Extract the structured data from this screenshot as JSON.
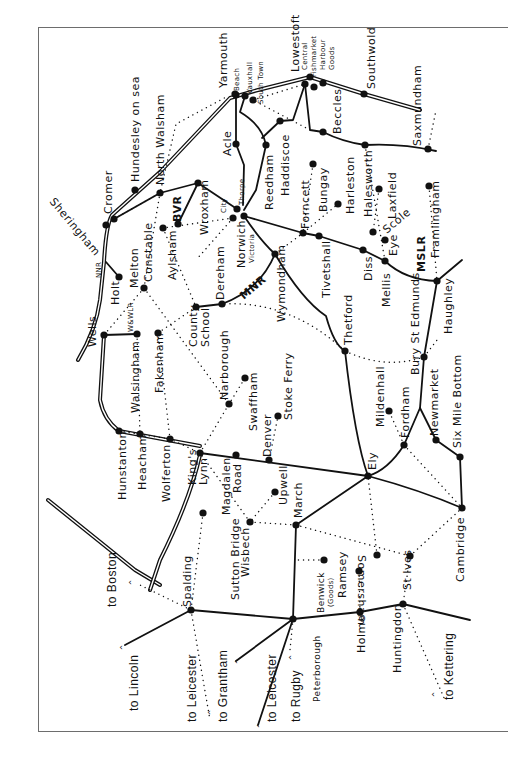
{
  "map": {
    "title": "East Anglia railway network",
    "colors": {
      "ink": "#111111",
      "frame": "#6d6d6d",
      "paper": "#ffffff"
    },
    "stations": [
      {
        "name": "Yarmouth",
        "x": 236,
        "y": 95
      },
      {
        "name": "Beach",
        "x": 235,
        "y": 94
      },
      {
        "name": "Vauxhall",
        "x": 245,
        "y": 96
      },
      {
        "name": "South Town",
        "x": 253,
        "y": 100
      },
      {
        "name": "Lowestoft",
        "x": 310,
        "y": 77
      },
      {
        "name": "Central",
        "x": 305,
        "y": 84
      },
      {
        "name": "Fishmarket",
        "x": 314,
        "y": 87
      },
      {
        "name": "Harbour",
        "x": 323,
        "y": 83
      },
      {
        "name": "Southwold",
        "x": 364,
        "y": 94
      },
      {
        "name": "Saxmundham",
        "x": 428,
        "y": 149
      },
      {
        "name": "Beccles",
        "x": 323,
        "y": 132
      },
      {
        "name": "Haddiscoe",
        "x": 280,
        "y": 121
      },
      {
        "name": "Acle",
        "x": 236,
        "y": 144
      },
      {
        "name": "Reedham",
        "x": 266,
        "y": 145
      },
      {
        "name": "Halesworth",
        "x": 365,
        "y": 145
      },
      {
        "name": "Laxfield",
        "x": 379,
        "y": 189
      },
      {
        "name": "Framlingham",
        "x": 429,
        "y": 186
      },
      {
        "name": "Harleston",
        "x": 338,
        "y": 204
      },
      {
        "name": "Bungay",
        "x": 313,
        "y": 164
      },
      {
        "name": "Forncett",
        "x": 303,
        "y": 233
      },
      {
        "name": "Tivetshall",
        "x": 319,
        "y": 236
      },
      {
        "name": "Diss",
        "x": 363,
        "y": 250
      },
      {
        "name": "Scole",
        "x": 373,
        "y": 232
      },
      {
        "name": "Eye",
        "x": 385,
        "y": 240
      },
      {
        "name": "Mellis",
        "x": 385,
        "y": 261
      },
      {
        "name": "Haughley",
        "x": 437,
        "y": 281
      },
      {
        "name": "Bury St Edmunds",
        "x": 424,
        "y": 357
      },
      {
        "name": "Thetford",
        "x": 345,
        "y": 351
      },
      {
        "name": "Wymondham",
        "x": 275,
        "y": 254
      },
      {
        "name": "Norwich Thorpe",
        "x": 237,
        "y": 209
      },
      {
        "name": "Norwich City",
        "x": 233,
        "y": 218
      },
      {
        "name": "Norwich Victoria",
        "x": 244,
        "y": 216
      },
      {
        "name": "Wroxham",
        "x": 198,
        "y": 183
      },
      {
        "name": "North Walsham",
        "x": 160,
        "y": 193
      },
      {
        "name": "Hundesley on sea",
        "x": 135,
        "y": 190
      },
      {
        "name": "Cromer",
        "x": 114,
        "y": 219
      },
      {
        "name": "Sheringham",
        "x": 106,
        "y": 225
      },
      {
        "name": "Aylsham",
        "x": 163,
        "y": 228
      },
      {
        "name": "BVR",
        "x": 178,
        "y": 224
      },
      {
        "name": "Melton Constable",
        "x": 144,
        "y": 288
      },
      {
        "name": "Holt",
        "x": 119,
        "y": 277
      },
      {
        "name": "Wells",
        "x": 104,
        "y": 335
      },
      {
        "name": "Walsingham",
        "x": 137,
        "y": 334
      },
      {
        "name": "Fakenham",
        "x": 158,
        "y": 333
      },
      {
        "name": "County School",
        "x": 196,
        "y": 307
      },
      {
        "name": "Dereham",
        "x": 222,
        "y": 304
      },
      {
        "name": "Narborough",
        "x": 229,
        "y": 404
      },
      {
        "name": "Swaffham",
        "x": 245,
        "y": 378
      },
      {
        "name": "Stoke Ferry",
        "x": 278,
        "y": 416
      },
      {
        "name": "Denver",
        "x": 269,
        "y": 460
      },
      {
        "name": "Hunstanton",
        "x": 119,
        "y": 431
      },
      {
        "name": "Heacham",
        "x": 140,
        "y": 434
      },
      {
        "name": "Wolferton",
        "x": 170,
        "y": 439
      },
      {
        "name": "King's Lynn",
        "x": 200,
        "y": 453
      },
      {
        "name": "Magdalen Road",
        "x": 236,
        "y": 455
      },
      {
        "name": "Upwell",
        "x": 275,
        "y": 492
      },
      {
        "name": "March",
        "x": 296,
        "y": 525
      },
      {
        "name": "Wisbech",
        "x": 250,
        "y": 522
      },
      {
        "name": "Sutton Bridge",
        "x": 203,
        "y": 513
      },
      {
        "name": "Spalding",
        "x": 191,
        "y": 610
      },
      {
        "name": "Ely",
        "x": 368,
        "y": 476
      },
      {
        "name": "Mildenhall",
        "x": 389,
        "y": 411
      },
      {
        "name": "Fordham",
        "x": 404,
        "y": 445
      },
      {
        "name": "Newmarket",
        "x": 436,
        "y": 440
      },
      {
        "name": "Six Mile Bottom",
        "x": 460,
        "y": 457
      },
      {
        "name": "Cambridge",
        "x": 462,
        "y": 508
      },
      {
        "name": "Somersham",
        "x": 377,
        "y": 555
      },
      {
        "name": "St Ives",
        "x": 410,
        "y": 556
      },
      {
        "name": "Ramsey",
        "x": 359,
        "y": 571
      },
      {
        "name": "Benwick (Goods)",
        "x": 324,
        "y": 560
      },
      {
        "name": "Holme",
        "x": 360,
        "y": 612
      },
      {
        "name": "Huntingdon",
        "x": 403,
        "y": 604
      },
      {
        "name": "Peterborough",
        "x": 293,
        "y": 619
      }
    ],
    "labels": [
      {
        "text": "Yarmouth",
        "x": 218,
        "y": 88,
        "cls": ""
      },
      {
        "text": "Beach",
        "x": 234,
        "y": 91,
        "cls": "sm"
      },
      {
        "text": "Vauxhall",
        "x": 247,
        "y": 94,
        "cls": "sm"
      },
      {
        "text": "South Town",
        "x": 258,
        "y": 104,
        "cls": "sm"
      },
      {
        "text": "Lowestoft",
        "x": 290,
        "y": 72,
        "cls": ""
      },
      {
        "text": "Central",
        "x": 302,
        "y": 70,
        "cls": "sm"
      },
      {
        "text": "Fishmarket",
        "x": 311,
        "y": 77,
        "cls": "sm"
      },
      {
        "text": "Harbour",
        "x": 320,
        "y": 70,
        "cls": "sm"
      },
      {
        "text": "Goods",
        "x": 329,
        "y": 70,
        "cls": "sm"
      },
      {
        "text": "Southwold",
        "x": 366,
        "y": 89,
        "cls": ""
      },
      {
        "text": "Saxmundham",
        "x": 412,
        "y": 146,
        "cls": ""
      },
      {
        "text": "Beccles",
        "x": 332,
        "y": 134,
        "cls": ""
      },
      {
        "text": "Haddiscoe",
        "x": 280,
        "y": 196,
        "cls": ""
      },
      {
        "text": "Acle",
        "x": 222,
        "y": 156,
        "cls": ""
      },
      {
        "text": "Reedham",
        "x": 264,
        "y": 210,
        "cls": ""
      },
      {
        "text": "Halesworth",
        "x": 363,
        "y": 217,
        "cls": ""
      },
      {
        "text": "Laxfield",
        "x": 387,
        "y": 219,
        "cls": ""
      },
      {
        "text": "Framlingham",
        "x": 430,
        "y": 258,
        "cls": ""
      },
      {
        "text": "Harleston",
        "x": 345,
        "y": 214,
        "cls": ""
      },
      {
        "text": "Bungay",
        "x": 318,
        "y": 212,
        "cls": ""
      },
      {
        "text": "Forncett",
        "x": 300,
        "y": 229,
        "cls": ""
      },
      {
        "text": "Tivetshall",
        "x": 321,
        "y": 298,
        "cls": ""
      },
      {
        "text": "Diss",
        "x": 363,
        "y": 281,
        "cls": ""
      },
      {
        "text": "Scole",
        "x": 381,
        "y": 227,
        "cls": "diag"
      },
      {
        "text": "Eye",
        "x": 388,
        "y": 256,
        "cls": ""
      },
      {
        "text": "Mellis",
        "x": 381,
        "y": 307,
        "cls": ""
      },
      {
        "text": "MSLR",
        "x": 416,
        "y": 272,
        "cls": "bold"
      },
      {
        "text": "Haughley",
        "x": 443,
        "y": 334,
        "cls": ""
      },
      {
        "text": "Bury St Edmunds",
        "x": 410,
        "y": 375,
        "cls": ""
      },
      {
        "text": "Thetford",
        "x": 343,
        "y": 345,
        "cls": ""
      },
      {
        "text": "Wymondham",
        "x": 276,
        "y": 322,
        "cls": ""
      },
      {
        "text": "Thorpe",
        "x": 239,
        "y": 205,
        "cls": "sm"
      },
      {
        "text": "City",
        "x": 221,
        "y": 213,
        "cls": "sm"
      },
      {
        "text": "Norwich",
        "x": 236,
        "y": 268,
        "cls": ""
      },
      {
        "text": "Victoria",
        "x": 249,
        "y": 263,
        "cls": "sm"
      },
      {
        "text": "Wroxham",
        "x": 199,
        "y": 235,
        "cls": ""
      },
      {
        "text": "North Walsham",
        "x": 155,
        "y": 185,
        "cls": ""
      },
      {
        "text": "Hundesley on sea",
        "x": 130,
        "y": 182,
        "cls": ""
      },
      {
        "text": "Cromer",
        "x": 103,
        "y": 214,
        "cls": ""
      },
      {
        "text": "Sheringham",
        "x": 56,
        "y": 196,
        "cls": "diag2"
      },
      {
        "text": "Aylsham",
        "x": 167,
        "y": 280,
        "cls": ""
      },
      {
        "text": "BVR",
        "x": 172,
        "y": 222,
        "cls": "bold"
      },
      {
        "text": "Melton",
        "x": 129,
        "y": 288,
        "cls": ""
      },
      {
        "text": "Constable",
        "x": 143,
        "y": 282,
        "cls": ""
      },
      {
        "text": "NNR",
        "x": 96,
        "y": 278,
        "cls": "sm"
      },
      {
        "text": "Holt",
        "x": 110,
        "y": 305,
        "cls": ""
      },
      {
        "text": "W&WLR",
        "x": 128,
        "y": 332,
        "cls": "sm"
      },
      {
        "text": "Wells",
        "x": 87,
        "y": 347,
        "cls": ""
      },
      {
        "text": "Walsingham",
        "x": 130,
        "y": 413,
        "cls": ""
      },
      {
        "text": "Fakenham",
        "x": 154,
        "y": 393,
        "cls": ""
      },
      {
        "text": "County",
        "x": 188,
        "y": 347,
        "cls": ""
      },
      {
        "text": "School",
        "x": 200,
        "y": 347,
        "cls": ""
      },
      {
        "text": "Dereham",
        "x": 215,
        "y": 300,
        "cls": ""
      },
      {
        "text": "MNR",
        "x": 238,
        "y": 293,
        "cls": "bold diag"
      },
      {
        "text": "Narborough",
        "x": 219,
        "y": 400,
        "cls": ""
      },
      {
        "text": "Swaffham",
        "x": 248,
        "y": 431,
        "cls": ""
      },
      {
        "text": "Stoke Ferry",
        "x": 283,
        "y": 420,
        "cls": ""
      },
      {
        "text": "Denver",
        "x": 262,
        "y": 457,
        "cls": ""
      },
      {
        "text": "Hunstanton",
        "x": 117,
        "y": 500,
        "cls": ""
      },
      {
        "text": "Heacham",
        "x": 137,
        "y": 490,
        "cls": ""
      },
      {
        "text": "Wolferton",
        "x": 161,
        "y": 502,
        "cls": ""
      },
      {
        "text": "King's",
        "x": 187,
        "y": 485,
        "cls": ""
      },
      {
        "text": "Lynn",
        "x": 198,
        "y": 485,
        "cls": ""
      },
      {
        "text": "Magdalen",
        "x": 221,
        "y": 515,
        "cls": ""
      },
      {
        "text": "Road",
        "x": 232,
        "y": 493,
        "cls": ""
      },
      {
        "text": "Upwell",
        "x": 278,
        "y": 505,
        "cls": ""
      },
      {
        "text": "March",
        "x": 293,
        "y": 518,
        "cls": ""
      },
      {
        "text": "Wisbech",
        "x": 240,
        "y": 577,
        "cls": ""
      },
      {
        "text": "Sutton Bridge",
        "x": 230,
        "y": 600,
        "cls": ""
      },
      {
        "text": "Spalding",
        "x": 182,
        "y": 607,
        "cls": ""
      },
      {
        "text": "Ely",
        "x": 367,
        "y": 470,
        "cls": ""
      },
      {
        "text": "Mildenhall",
        "x": 375,
        "y": 427,
        "cls": ""
      },
      {
        "text": "Fordham",
        "x": 400,
        "y": 438,
        "cls": ""
      },
      {
        "text": "Newmarket",
        "x": 429,
        "y": 436,
        "cls": ""
      },
      {
        "text": "Six Mile Bottom",
        "x": 452,
        "y": 448,
        "cls": ""
      },
      {
        "text": "Cambridge",
        "x": 455,
        "y": 582,
        "cls": ""
      },
      {
        "text": "Somersham",
        "x": 367,
        "y": 555,
        "cls": "r"
      },
      {
        "text": "St Ives",
        "x": 402,
        "y": 590,
        "cls": ""
      },
      {
        "text": "Ramsey",
        "x": 337,
        "y": 598,
        "cls": ""
      },
      {
        "text": "Benwick",
        "x": 317,
        "y": 613,
        "cls": "md"
      },
      {
        "text": "(Goods)",
        "x": 328,
        "y": 607,
        "cls": "sm"
      },
      {
        "text": "Holme",
        "x": 356,
        "y": 653,
        "cls": ""
      },
      {
        "text": "Huntingdon",
        "x": 392,
        "y": 673,
        "cls": ""
      },
      {
        "text": "Peterborough",
        "x": 313,
        "y": 702,
        "cls": "md"
      },
      {
        "text": "to Boston",
        "x": 106,
        "y": 607,
        "cls": "sans2"
      },
      {
        "text": "to Lincoln",
        "x": 128,
        "y": 711,
        "cls": "sans2"
      },
      {
        "text": "to Leicester",
        "x": 186,
        "y": 722,
        "cls": "sans2"
      },
      {
        "text": "to Grantham",
        "x": 217,
        "y": 722,
        "cls": "sans2"
      },
      {
        "text": "to Leicester",
        "x": 266,
        "y": 722,
        "cls": "sans2"
      },
      {
        "text": "to Rugby",
        "x": 290,
        "y": 722,
        "cls": "sans2"
      },
      {
        "text": "to Kettering",
        "x": 443,
        "y": 700,
        "cls": "sans2"
      }
    ],
    "lines": {
      "solid": [
        "M236,95 L236,144 L244,165 L243,205",
        "M245,96 L240,112 Q262,125 266,145 L256,190 L244,210",
        "M305,84 L293,120 L280,121 L262,138",
        "M305,84 L310,130 L323,132 Q343,142 365,145 Q400,143 436,151",
        "M244,216 L303,233 L319,236 L363,250 L385,261 Q405,280 437,281 L462,260",
        "M244,216 Q260,240 275,254 Q302,300 326,316 Q334,345 345,351",
        "M275,254 Q260,290 222,304 L196,307",
        "M237,209 L198,183 L160,193 L114,219",
        "M198,183 L178,224",
        "M119,277 L106,262",
        "M104,335 L137,334",
        "M437,281 L424,357 L420,408 L436,440 L460,457 L462,508",
        "M420,408 L404,445 Q388,470 368,476 Q355,440 345,351",
        "M368,476 Q420,490 462,508",
        "M368,476 L200,453",
        "M368,476 L296,525 L293,619",
        "M293,619 L360,612 L403,604 L470,620",
        "M293,619 L191,610 L125,645",
        "M293,619 L236,661",
        "M293,619 L258,725"
      ],
      "dotted": [
        "M114,219 L160,193 L176,124 L228,96",
        "M144,288 L104,335",
        "M144,288 L160,193",
        "M144,288 L229,404",
        "M163,228 L196,307",
        "M196,307 L158,333",
        "M158,333 L170,439",
        "M137,334 L140,434",
        "M119,431 L170,439 L200,453",
        "M200,453 L229,404 L245,378",
        "M269,460 L278,416",
        "M203,513 L191,610",
        "M250,522 L200,453",
        "M250,522 L296,525 L410,556",
        "M275,492 L250,522",
        "M324,560 L296,560",
        "M360,612 L359,571",
        "M377,555 L368,476",
        "M410,556 L403,604",
        "M410,556 L462,508",
        "M404,445 L389,411",
        "M404,445 L462,508",
        "M345,351 Q385,370 424,357 L437,340",
        "M345,351 Q290,300 222,304",
        "M275,254 L303,233 L338,204",
        "M313,164 L303,233",
        "M365,145 L385,261",
        "M379,189 L373,232",
        "M429,186 L437,281",
        "M253,100 L305,84",
        "M310,130 L253,100",
        "M428,149 L436,110",
        "M191,610 L140,585",
        "M191,610 L210,720",
        "M403,604 L445,700",
        "M293,619 L290,650",
        "M233,218 L163,228",
        "M233,218 L196,260"
      ],
      "coast": [
        "M78,360 Q96,330 100,300 L104,262 Q106,225 112,215 L160,172 L230,98 L258,90 L310,77 L364,94 L420,110",
        "M104,335 L100,400 Q104,420 119,431 L200,446",
        "M48,500 Q110,550 135,570 L160,585",
        "M200,455 Q190,500 160,560 L150,590"
      ]
    },
    "arrows": [
      {
        "label": "to Boston",
        "x": 130,
        "y": 585
      },
      {
        "label": "to Lincoln",
        "x": 121,
        "y": 650
      },
      {
        "label": "to Leicester (dotted)",
        "x": 209,
        "y": 715
      },
      {
        "label": "to Grantham",
        "x": 236,
        "y": 664
      },
      {
        "label": "to Leicester",
        "x": 258,
        "y": 728
      },
      {
        "label": "to Rugby",
        "x": 290,
        "y": 660
      },
      {
        "label": "to Kettering",
        "x": 433,
        "y": 697
      }
    ]
  }
}
